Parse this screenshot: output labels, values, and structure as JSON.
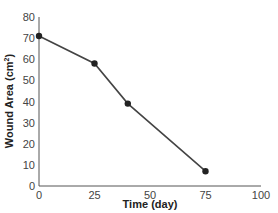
{
  "chart_data": {
    "type": "line",
    "title": "",
    "xlabel": "Time (day)",
    "ylabel": "Wound Area (cm²)",
    "ylabel_base": "Wound Area (cm",
    "ylabel_sup": "2",
    "ylabel_end": ")",
    "x": [
      0,
      25,
      40,
      75
    ],
    "values": [
      71,
      58,
      39,
      7
    ],
    "xlim": [
      0,
      100
    ],
    "ylim": [
      0,
      80
    ],
    "xticks": [
      "0",
      "25",
      "50",
      "75",
      "100"
    ],
    "yticks": [
      "0",
      "10",
      "20",
      "30",
      "40",
      "50",
      "60",
      "70",
      "80"
    ],
    "grid": false,
    "legend": null,
    "colors": {
      "line": "#444444",
      "marker": "#222222",
      "axis": "#555555"
    }
  }
}
